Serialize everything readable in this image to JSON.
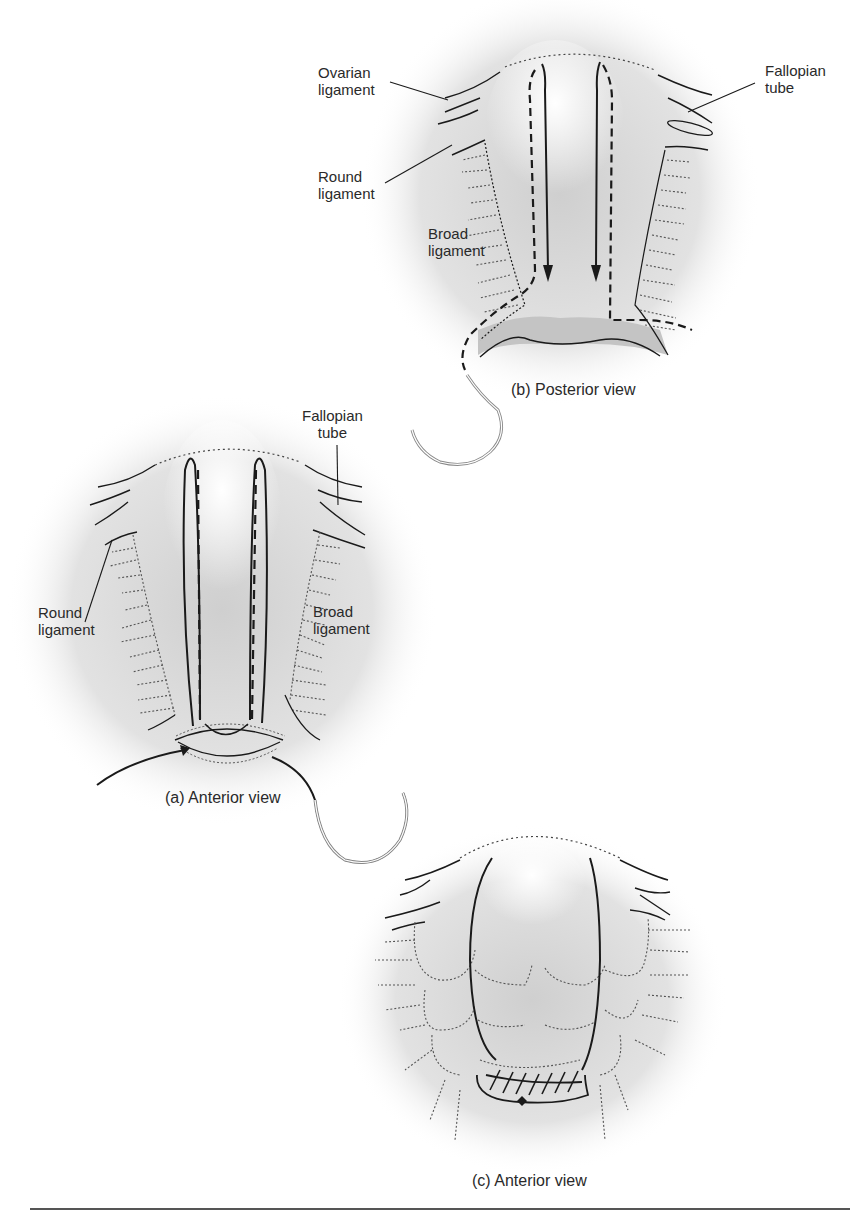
{
  "figure": {
    "panels": [
      {
        "id": "b",
        "caption": "(b) Posterior view",
        "labels": {
          "ovarian_ligament": "Ovarian\nligament",
          "round_ligament": "Round\nligament",
          "broad_ligament": "Broad\nligament",
          "fallopian_tube": "Fallopian\ntube"
        }
      },
      {
        "id": "a",
        "caption": "(a) Anterior view",
        "labels": {
          "fallopian_tube": "Fallopian\ntube",
          "round_ligament": "Round\nligament",
          "broad_ligament": "Broad\nligament"
        }
      },
      {
        "id": "c",
        "caption": "(c) Anterior view",
        "labels": {}
      }
    ],
    "colors": {
      "tissue_shade": "#cfcfcf",
      "line": "#1a1a1a",
      "dotted": "#444444",
      "needle": "#8a8a8a"
    }
  }
}
